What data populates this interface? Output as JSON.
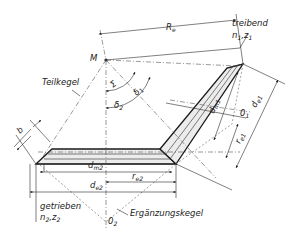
{
  "labels": {
    "M": "M",
    "Re": "R",
    "Re_sub": "e",
    "treibend": "treibend",
    "n1z1": "n",
    "n1z1_sub1": "1",
    "n1z1_mid": ",z",
    "n1z1_sub2": "1",
    "teilkegel": "Teilkegel",
    "sigma": "Σ",
    "delta1": "δ",
    "delta1_sub": "1",
    "delta2": "δ",
    "delta2_sub": "2",
    "b": "b",
    "dm1": "d",
    "dm1_sub": "m1",
    "de1": "d",
    "de1_sub": "e1",
    "re1": "r",
    "re1_sub": "e1",
    "O1": "0",
    "O1_sub": "1",
    "dm2": "d",
    "dm2_sub": "m2",
    "re2": "r",
    "re2_sub": "e2",
    "de2": "d",
    "de2_sub": "e2",
    "getrieben": "getrieben",
    "n2z2": "n",
    "n2z2_sub1": "2",
    "n2z2_mid": ",z",
    "n2z2_sub2": "2",
    "O2": "0",
    "O2_sub": "2",
    "ergaenzungskegel": "Ergänzungskegel"
  },
  "colors": {
    "line": "#1a1a1a",
    "shade": "#ececec",
    "text": "#222222"
  }
}
